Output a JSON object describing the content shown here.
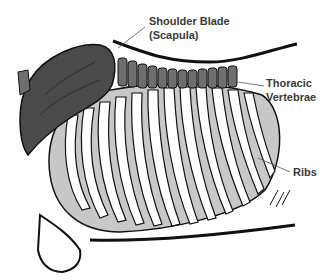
{
  "diagram": {
    "labels": [
      {
        "id": "scapula",
        "line1": "Shoulder Blade",
        "line2": "(Scapula)"
      },
      {
        "id": "thoracic",
        "line1": "Thoracic",
        "line2": "Vertebrae"
      },
      {
        "id": "ribs",
        "line1": "Ribs",
        "line2": ""
      }
    ],
    "colors": {
      "scapula": "#4a4a4a",
      "vertebrae": "#6e6e6e",
      "rib_shade": "#c8c8c8",
      "outline": "#111111",
      "label_text": "#3a3a3a",
      "leader_line": "#555555",
      "background": "#ffffff"
    }
  }
}
